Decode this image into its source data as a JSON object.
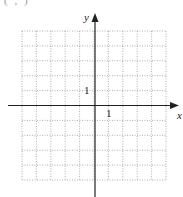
{
  "diagram": {
    "type": "coordinate-grid",
    "cropped_header_fragment": "( , )",
    "grid": {
      "columns": 10,
      "rows": 10,
      "x_range": [
        -5,
        5
      ],
      "y_range": [
        -5,
        5
      ],
      "line_style": "dotted",
      "line_color": "#9a9a9a"
    },
    "axes": {
      "x_label": "x",
      "y_label": "y",
      "x_tick_label": "1",
      "y_tick_label": "1",
      "axis_color": "#222222"
    }
  }
}
